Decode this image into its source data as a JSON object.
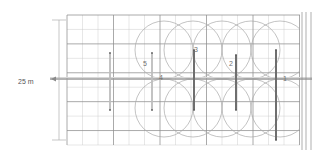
{
  "drawing": {
    "type": "engineering-plan",
    "background": "#ffffff",
    "canvas": {
      "width": 330,
      "height": 159
    },
    "colors": {
      "grid_minor": "#c9c9c9",
      "grid_major": "#8e8e8e",
      "circle": "#a9a9a9",
      "bar_dark": "#6e6e6e",
      "bar_light": "#bdbdbd",
      "centerline": "#9a9a9a",
      "dimension": "#b0b0b0",
      "text": "#666666"
    }
  },
  "dimension": {
    "label": "25 m",
    "orientation": "vertical",
    "line_x": 59,
    "top_y": 20,
    "bottom_y": 140,
    "tick_half_width": 7,
    "label_x": 30,
    "label_y": 82
  },
  "centerline": {
    "name": "main-axis",
    "y": 79,
    "x_start": 50,
    "x_end": 312,
    "marker": "arrow-left",
    "marker_x": 51
  },
  "grid": {
    "x_start": 67,
    "x_end": 300,
    "y_start": 15,
    "y_end": 145,
    "cell": 15.5,
    "columns": 16,
    "rows": 9,
    "major_every": 3
  },
  "circles": [
    {
      "cx": 193,
      "cy": 50,
      "r": 29
    },
    {
      "cx": 193,
      "cy": 108,
      "r": 29
    },
    {
      "cx": 222,
      "cy": 50,
      "r": 29
    },
    {
      "cx": 222,
      "cy": 108,
      "r": 29
    },
    {
      "cx": 251,
      "cy": 50,
      "r": 29
    },
    {
      "cx": 251,
      "cy": 108,
      "r": 29
    },
    {
      "cx": 280,
      "cy": 50,
      "r": 29
    },
    {
      "cx": 280,
      "cy": 108,
      "r": 29
    },
    {
      "cx": 164,
      "cy": 50,
      "r": 29
    },
    {
      "cx": 164,
      "cy": 108,
      "r": 29
    }
  ],
  "bars": [
    {
      "id": "1",
      "x": 276,
      "y_top": 50,
      "y_bottom": 140,
      "width": 2.0,
      "shade": "dark"
    },
    {
      "id": "2",
      "x": 236,
      "y_top": 55,
      "y_bottom": 110,
      "width": 2.0,
      "shade": "dark"
    },
    {
      "id": "3",
      "x": 194,
      "y_top": 50,
      "y_bottom": 110,
      "width": 2.0,
      "shade": "dark"
    },
    {
      "id": "4",
      "x": 152,
      "y_top": 53,
      "y_bottom": 110,
      "width": 1.8,
      "shade": "light"
    },
    {
      "id": "5",
      "x": 110,
      "y_top": 53,
      "y_bottom": 110,
      "width": 1.8,
      "shade": "light"
    }
  ],
  "labels": [
    {
      "text": "1",
      "x": 285,
      "y": 79
    },
    {
      "text": "2",
      "x": 231,
      "y": 64
    },
    {
      "text": "3",
      "x": 196,
      "y": 50
    },
    {
      "text": "4",
      "x": 161,
      "y": 78
    },
    {
      "text": "5",
      "x": 145,
      "y": 64
    },
    {
      "text": "25 m",
      "x": 18,
      "y": 82
    }
  ],
  "right_edge_lines": [
    {
      "x": 302,
      "y_top": 12,
      "y_bottom": 150
    },
    {
      "x": 306,
      "y_top": 12,
      "y_bottom": 150
    },
    {
      "x": 311,
      "y_top": 12,
      "y_bottom": 150
    }
  ]
}
